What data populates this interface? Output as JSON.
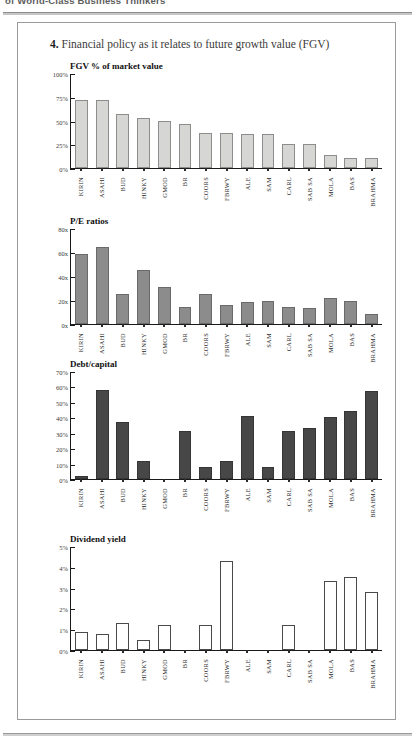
{
  "page": {
    "header_text": "of World-Class Business Thinkers",
    "figure_title_number": "4.",
    "figure_title_text": "Financial policy as it relates to future growth value (FGV)"
  },
  "categories": [
    "KIRIN",
    "ASAHI",
    "BUD",
    "HINKY",
    "GMOD",
    "BR",
    "COORS",
    "FBRWY",
    "ALE",
    "SAM",
    "CARL",
    "SAB SA",
    "MOLA",
    "BAS",
    "BRAHMA"
  ],
  "chart_data": [
    {
      "type": "bar",
      "id": "fgv-percent-of-market-value",
      "title": "FGV % of market value",
      "xlabel": "",
      "ylabel": "",
      "ylim": [
        0,
        100
      ],
      "tick_labels": [
        "0%",
        "25%",
        "50%",
        "75%",
        "100%"
      ],
      "tick_values": [
        0,
        25,
        50,
        75,
        100
      ],
      "grid": false,
      "bar_style": "fill-light",
      "categories": [
        "KIRIN",
        "ASAHI",
        "BUD",
        "HINKY",
        "GMOD",
        "BR",
        "COORS",
        "FBRWY",
        "ALE",
        "SAM",
        "CARL",
        "SAB SA",
        "MOLA",
        "BAS",
        "BRAHMA"
      ],
      "values": [
        72,
        72,
        57,
        53,
        49,
        46,
        37,
        37,
        36,
        36,
        25,
        25,
        14,
        11,
        11
      ]
    },
    {
      "type": "bar",
      "id": "pe-ratios",
      "title": "P/E ratios",
      "xlabel": "",
      "ylabel": "",
      "ylim": [
        0,
        80
      ],
      "tick_labels": [
        "0x",
        "20x",
        "40x",
        "60x",
        "80x"
      ],
      "tick_values": [
        0,
        20,
        40,
        60,
        80
      ],
      "grid": false,
      "bar_style": "fill-mid",
      "categories": [
        "KIRIN",
        "ASAHI",
        "BUD",
        "HINKY",
        "GMOD",
        "BR",
        "COORS",
        "FBRWY",
        "ALE",
        "SAM",
        "CARL",
        "SAB SA",
        "MOLA",
        "BAS",
        "BRAHMA"
      ],
      "values": [
        58,
        64,
        25,
        45,
        31,
        14,
        25,
        16,
        18,
        19,
        14,
        13,
        22,
        19,
        8
      ]
    },
    {
      "type": "bar",
      "id": "debt-capital",
      "title": "Debt/capital",
      "xlabel": "",
      "ylabel": "",
      "ylim": [
        0,
        70
      ],
      "tick_labels": [
        "0%",
        "10%",
        "20%",
        "30%",
        "40%",
        "50%",
        "60%",
        "70%"
      ],
      "tick_values": [
        0,
        10,
        20,
        30,
        40,
        50,
        60,
        70
      ],
      "grid": false,
      "bar_style": "fill-dark",
      "categories": [
        "KIRIN",
        "ASAHI",
        "BUD",
        "HINKY",
        "GMOD",
        "BR",
        "COORS",
        "FBRWY",
        "ALE",
        "SAM",
        "CARL",
        "SAB SA",
        "MOLA",
        "BAS",
        "BRAHMA"
      ],
      "values": [
        2,
        58,
        37,
        12,
        0,
        31,
        8,
        12,
        41,
        8,
        31,
        33,
        40,
        44,
        57
      ]
    },
    {
      "type": "bar",
      "id": "dividend-yield",
      "title": "Dividend yield",
      "xlabel": "",
      "ylabel": "",
      "ylim": [
        0,
        5
      ],
      "tick_labels": [
        "0%",
        "1%",
        "2%",
        "3%",
        "4%",
        "5%"
      ],
      "tick_values": [
        0,
        1,
        2,
        3,
        4,
        5
      ],
      "grid": false,
      "bar_style": "fill-open",
      "categories": [
        "KIRIN",
        "ASAHI",
        "BUD",
        "HINKY",
        "GMOD",
        "BR",
        "COORS",
        "FBRWY",
        "ALE",
        "SAM",
        "CARL",
        "SAB SA",
        "MOLA",
        "BAS",
        "BRAHMA"
      ],
      "values": [
        0.85,
        0.75,
        1.3,
        0.5,
        1.2,
        0,
        1.2,
        4.3,
        0,
        0,
        1.2,
        0,
        3.3,
        3.5,
        2.8
      ]
    }
  ],
  "layout": {
    "chart_tops": [
      60,
      215,
      358,
      533
    ],
    "plot_heights": [
      95,
      96,
      108,
      104
    ],
    "xlabel_tops": [
      163,
      318,
      465,
      645
    ]
  }
}
